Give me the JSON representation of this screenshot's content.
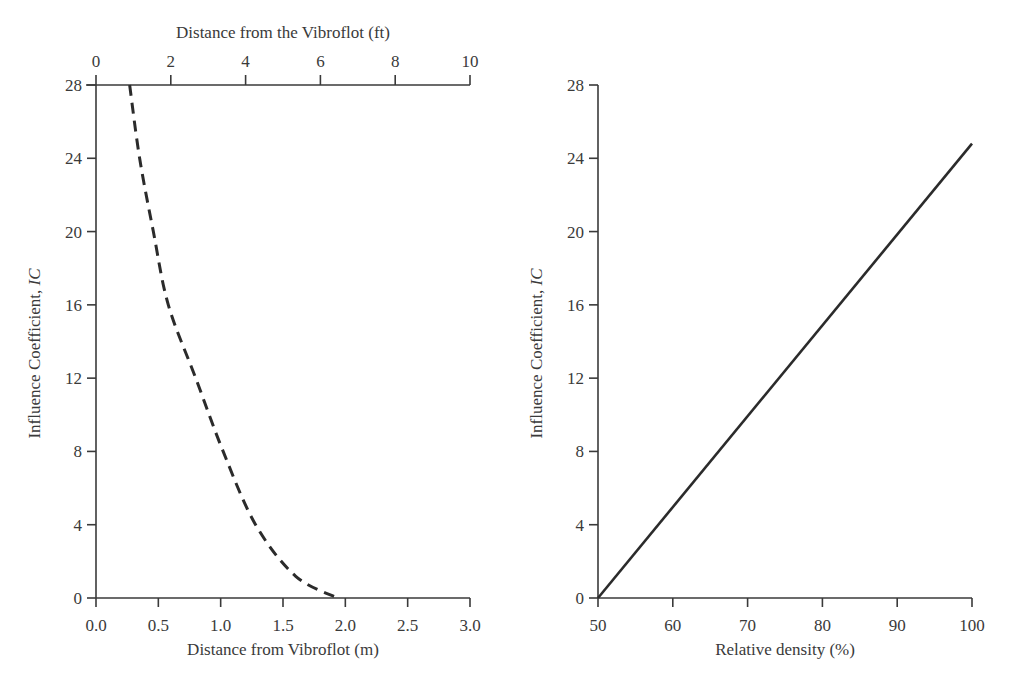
{
  "chart_data": [
    {
      "type": "line",
      "title": "",
      "xlabel": "Distance from Vibroflot (m)",
      "xlabel_top": "Distance from the Vibroflot (ft)",
      "ylabel": "Influence Coefficient, IC",
      "xlim": [
        0,
        3.0
      ],
      "xlim_top": [
        0,
        10
      ],
      "ylim": [
        0,
        28
      ],
      "x_ticks": [
        "0.0",
        "0.5",
        "1.0",
        "1.5",
        "2.0",
        "2.5",
        "3.0"
      ],
      "x_ticks_top": [
        "0",
        "2",
        "4",
        "6",
        "8",
        "10"
      ],
      "y_ticks": [
        "0",
        "4",
        "8",
        "12",
        "16",
        "20",
        "24",
        "28"
      ],
      "grid": false,
      "series": [
        {
          "name": "Influence coefficient vs distance",
          "style": "dashed",
          "x": [
            0.27,
            0.35,
            0.46,
            0.58,
            0.8,
            1.02,
            1.28,
            1.6,
            1.94
          ],
          "y": [
            28,
            24,
            20,
            16,
            12,
            8,
            4,
            1.2,
            0
          ]
        }
      ]
    },
    {
      "type": "line",
      "title": "",
      "xlabel": "Relative density (%)",
      "ylabel": "Influence Coefficient, IC",
      "xlim": [
        50,
        100
      ],
      "ylim": [
        0,
        28
      ],
      "x_ticks": [
        "50",
        "60",
        "70",
        "80",
        "90",
        "100"
      ],
      "y_ticks": [
        "0",
        "4",
        "8",
        "12",
        "16",
        "20",
        "24",
        "28"
      ],
      "grid": false,
      "series": [
        {
          "name": "Influence coefficient vs relative density",
          "style": "solid",
          "x": [
            50,
            100
          ],
          "y": [
            0,
            24.8
          ]
        }
      ]
    }
  ],
  "left": {
    "top_axis_title": "Distance from the Vibroflot (ft)",
    "bottom_axis_title": "Distance from Vibroflot (m)",
    "y_axis_title": "Influence Coefficient, ",
    "y_axis_title_italic": "IC"
  },
  "right": {
    "bottom_axis_title": "Relative density (%)",
    "y_axis_title": "Influence Coefficient, ",
    "y_axis_title_italic": "IC"
  }
}
